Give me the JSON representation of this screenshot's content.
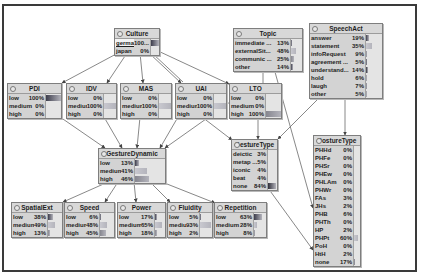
{
  "nodes": {
    "culture": {
      "title": "Culture",
      "states": [
        {
          "label": "german",
          "pct": "100...",
          "value": 100,
          "evidence": true
        },
        {
          "label": "japan",
          "pct": "0%",
          "value": 0
        }
      ]
    },
    "topic": {
      "title": "Topic",
      "states": [
        {
          "label": "immediate ...",
          "pct": "13%",
          "value": 13
        },
        {
          "label": "externalSit...",
          "pct": "48%",
          "value": 48
        },
        {
          "label": "communic ...",
          "pct": "25%",
          "value": 25
        },
        {
          "label": "other",
          "pct": "14%",
          "value": 14
        }
      ]
    },
    "speechact": {
      "title": "SpeechAct",
      "states": [
        {
          "label": "answer",
          "pct": "19%",
          "value": 19
        },
        {
          "label": "statement",
          "pct": "35%",
          "value": 35
        },
        {
          "label": "infoRequest",
          "pct": "9%",
          "value": 9
        },
        {
          "label": "agreement ...",
          "pct": "5%",
          "value": 5
        },
        {
          "label": "understand...",
          "pct": "14%",
          "value": 14
        },
        {
          "label": "hold",
          "pct": "6%",
          "value": 6
        },
        {
          "label": "laugh",
          "pct": "7%",
          "value": 7
        },
        {
          "label": "other",
          "pct": "5%",
          "value": 5
        }
      ]
    },
    "pdi": {
      "title": "PDI",
      "states": [
        {
          "label": "low",
          "pct": "100%",
          "value": 100
        },
        {
          "label": "medium",
          "pct": "0%",
          "value": 0
        },
        {
          "label": "high",
          "pct": "0%",
          "value": 0
        }
      ]
    },
    "idv": {
      "title": "IDV",
      "states": [
        {
          "label": "low",
          "pct": "0%",
          "value": 0
        },
        {
          "label": "medium",
          "pct": "100%",
          "value": 100
        },
        {
          "label": "high",
          "pct": "0%",
          "value": 0
        }
      ]
    },
    "mas": {
      "title": "MAS",
      "states": [
        {
          "label": "low",
          "pct": "0%",
          "value": 0
        },
        {
          "label": "medium",
          "pct": "100%",
          "value": 100
        },
        {
          "label": "high",
          "pct": "0%",
          "value": 0
        }
      ]
    },
    "uai": {
      "title": "UAI",
      "states": [
        {
          "label": "low",
          "pct": "0%",
          "value": 0
        },
        {
          "label": "medium",
          "pct": "100%",
          "value": 100
        },
        {
          "label": "high",
          "pct": "0%",
          "value": 0
        }
      ]
    },
    "lto": {
      "title": "LTO",
      "states": [
        {
          "label": "low",
          "pct": "0%",
          "value": 0
        },
        {
          "label": "medium",
          "pct": "0%",
          "value": 0
        },
        {
          "label": "high",
          "pct": "100%",
          "value": 100
        }
      ]
    },
    "gesturedynamic": {
      "title": "GestureDynamic",
      "states": [
        {
          "label": "low",
          "pct": "13%",
          "value": 13
        },
        {
          "label": "medium",
          "pct": "41%",
          "value": 41
        },
        {
          "label": "high",
          "pct": "46%",
          "value": 46
        }
      ]
    },
    "gesturetype": {
      "title": "GestureType",
      "states": [
        {
          "label": "deictic",
          "pct": "3%",
          "value": 3
        },
        {
          "label": "metap ...",
          "pct": "5%",
          "value": 5
        },
        {
          "label": "iconic",
          "pct": "4%",
          "value": 4
        },
        {
          "label": "beat",
          "pct": "4%",
          "value": 4
        },
        {
          "label": "none",
          "pct": "84%",
          "value": 84
        }
      ]
    },
    "posturetype": {
      "title": "PostureType",
      "states": [
        {
          "label": "PHHd",
          "pct": "0%",
          "value": 0
        },
        {
          "label": "PHFe",
          "pct": "0%",
          "value": 0
        },
        {
          "label": "PHSr",
          "pct": "0%",
          "value": 0
        },
        {
          "label": "PHEw",
          "pct": "0%",
          "value": 0
        },
        {
          "label": "PHLAm",
          "pct": "0%",
          "value": 0
        },
        {
          "label": "PHWr",
          "pct": "0%",
          "value": 0
        },
        {
          "label": "FAs",
          "pct": "3%",
          "value": 3
        },
        {
          "label": "JHs",
          "pct": "2%",
          "value": 2
        },
        {
          "label": "PHB",
          "pct": "6%",
          "value": 6
        },
        {
          "label": "PHTh",
          "pct": "0%",
          "value": 0
        },
        {
          "label": "HP",
          "pct": "2%",
          "value": 2
        },
        {
          "label": "PHPt",
          "pct": "60%",
          "value": 60
        },
        {
          "label": "PoH",
          "pct": "0%",
          "value": 0
        },
        {
          "label": "HtH",
          "pct": "2%",
          "value": 2
        },
        {
          "label": "none",
          "pct": "17%",
          "value": 17
        }
      ]
    },
    "spatialext": {
      "title": "SpatialExt",
      "states": [
        {
          "label": "low",
          "pct": "38%",
          "value": 38
        },
        {
          "label": "medium",
          "pct": "49%",
          "value": 49
        },
        {
          "label": "high",
          "pct": "13%",
          "value": 13
        }
      ]
    },
    "speed": {
      "title": "Speed",
      "states": [
        {
          "label": "low",
          "pct": "6%",
          "value": 6
        },
        {
          "label": "medium",
          "pct": "48%",
          "value": 48
        },
        {
          "label": "high",
          "pct": "45%",
          "value": 45
        }
      ]
    },
    "power": {
      "title": "Power",
      "states": [
        {
          "label": "low",
          "pct": "17%",
          "value": 17
        },
        {
          "label": "medium",
          "pct": "65%",
          "value": 65
        },
        {
          "label": "high",
          "pct": "18%",
          "value": 18
        }
      ]
    },
    "fluidity": {
      "title": "Fluidity",
      "states": [
        {
          "label": "low",
          "pct": "5%",
          "value": 5
        },
        {
          "label": "medium",
          "pct": "93%",
          "value": 93
        },
        {
          "label": "high",
          "pct": "2%",
          "value": 2
        }
      ]
    },
    "repetition": {
      "title": "Repetition",
      "states": [
        {
          "label": "low",
          "pct": "63%",
          "value": 63
        },
        {
          "label": "medium",
          "pct": "28%",
          "value": 28
        },
        {
          "label": "high",
          "pct": "8%",
          "value": 8
        }
      ]
    }
  },
  "edges": [
    {
      "from": "Culture",
      "to": "PDI"
    },
    {
      "from": "Culture",
      "to": "IDV"
    },
    {
      "from": "Culture",
      "to": "MAS"
    },
    {
      "from": "Culture",
      "to": "UAI"
    },
    {
      "from": "Culture",
      "to": "LTO"
    },
    {
      "from": "PDI",
      "to": "GestureDynamic"
    },
    {
      "from": "IDV",
      "to": "GestureDynamic"
    },
    {
      "from": "MAS",
      "to": "GestureDynamic"
    },
    {
      "from": "UAI",
      "to": "GestureDynamic"
    },
    {
      "from": "LTO",
      "to": "GestureDynamic"
    },
    {
      "from": "UAI",
      "to": "GestureType"
    },
    {
      "from": "LTO",
      "to": "GestureType"
    },
    {
      "from": "Topic",
      "to": "GestureType"
    },
    {
      "from": "SpeechAct",
      "to": "GestureType"
    },
    {
      "from": "SpeechAct",
      "to": "PostureType"
    },
    {
      "from": "Topic",
      "to": "PostureType"
    },
    {
      "from": "GestureType",
      "to": "PostureType"
    },
    {
      "from": "GestureDynamic",
      "to": "SpatialExt"
    },
    {
      "from": "GestureDynamic",
      "to": "Speed"
    },
    {
      "from": "GestureDynamic",
      "to": "Power"
    },
    {
      "from": "GestureDynamic",
      "to": "Fluidity"
    },
    {
      "from": "GestureDynamic",
      "to": "Repetition"
    }
  ],
  "bar_palette": [
    "#3d3d4c",
    "#c8c8cf",
    "#86868f",
    "#3d3d4c",
    "#2f2f3a",
    "#9a9aa2",
    "#7a7a84",
    "#9a9aa2",
    "#6a6a74",
    "#9a9aa2",
    "#9a9aa2",
    "#c8c8cf",
    "#9a9aa2",
    "#9a9aa2",
    "#6a6a74"
  ]
}
